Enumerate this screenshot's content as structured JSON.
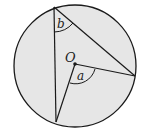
{
  "diagram": {
    "labels": {
      "center": "O",
      "central_angle": "a",
      "inscribed_angle": "b"
    },
    "colors": {
      "fill": "#e6e6e6",
      "stroke": "#1a1a1a",
      "background": "#ffffff"
    }
  }
}
